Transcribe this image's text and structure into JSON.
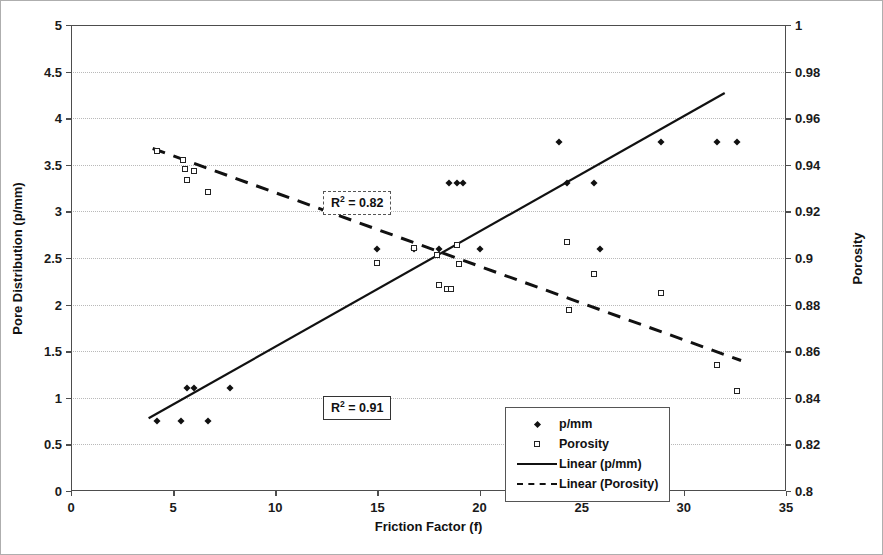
{
  "chart_data": {
    "type": "scatter",
    "title": "",
    "xlabel": "Friction Factor (f)",
    "ylabel": "Pore Distribution (p/mm)",
    "y2label": "Porosity",
    "xlim": [
      0,
      35
    ],
    "ylim": [
      0,
      5
    ],
    "y2lim": [
      0.8,
      1
    ],
    "grid": true,
    "legend_position": "center",
    "xticks": [
      "0",
      "5",
      "10",
      "15",
      "20",
      "25",
      "30",
      "35"
    ],
    "xtick_values": [
      0,
      5,
      10,
      15,
      20,
      25,
      30,
      35
    ],
    "yticks": [
      "0",
      "0.5",
      "1",
      "1.5",
      "2",
      "2.5",
      "3",
      "3.5",
      "4",
      "4.5",
      "5"
    ],
    "ytick_values": [
      0,
      0.5,
      1,
      1.5,
      2,
      2.5,
      3,
      3.5,
      4,
      4.5,
      5
    ],
    "y2ticks": [
      "0.8",
      "0.82",
      "0.84",
      "0.86",
      "0.88",
      "0.9",
      "0.92",
      "0.94",
      "0.96",
      "0.98",
      "1"
    ],
    "y2tick_values": [
      0.8,
      0.82,
      0.84,
      0.86,
      0.88,
      0.9,
      0.92,
      0.94,
      0.96,
      0.98,
      1
    ],
    "series": [
      {
        "name": "p/mm",
        "marker": "filled-diamond",
        "axis": "left",
        "points": [
          [
            4.2,
            0.75
          ],
          [
            5.4,
            0.75
          ],
          [
            5.7,
            1.1
          ],
          [
            6.0,
            1.1
          ],
          [
            6.7,
            0.75
          ],
          [
            7.8,
            1.1
          ],
          [
            15.0,
            2.6
          ],
          [
            16.8,
            2.6
          ],
          [
            18.0,
            2.6
          ],
          [
            18.5,
            3.3
          ],
          [
            18.9,
            3.3
          ],
          [
            19.2,
            3.3
          ],
          [
            20.0,
            2.6
          ],
          [
            23.9,
            3.75
          ],
          [
            24.3,
            3.3
          ],
          [
            25.6,
            3.3
          ],
          [
            25.9,
            2.6
          ],
          [
            28.9,
            3.75
          ],
          [
            31.6,
            3.75
          ],
          [
            32.6,
            3.75
          ]
        ]
      },
      {
        "name": "Porosity",
        "marker": "open-square",
        "axis": "right",
        "points": [
          [
            4.2,
            0.946
          ],
          [
            5.5,
            0.942
          ],
          [
            5.6,
            0.938
          ],
          [
            5.7,
            0.9335
          ],
          [
            6.0,
            0.9375
          ],
          [
            6.7,
            0.9285
          ],
          [
            15.0,
            0.898
          ],
          [
            16.8,
            0.9045
          ],
          [
            17.9,
            0.9015
          ],
          [
            18.0,
            0.8885
          ],
          [
            18.4,
            0.8865
          ],
          [
            18.6,
            0.8865
          ],
          [
            18.9,
            0.9055
          ],
          [
            19.0,
            0.8975
          ],
          [
            24.3,
            0.907
          ],
          [
            24.4,
            0.8775
          ],
          [
            25.6,
            0.893
          ],
          [
            28.9,
            0.885
          ],
          [
            31.6,
            0.854
          ],
          [
            32.6,
            0.843
          ]
        ]
      }
    ],
    "trendlines": [
      {
        "name": "Linear (p/mm)",
        "style": "solid",
        "axis": "left",
        "x_start": 3.8,
        "y_start": 0.78,
        "x_end": 32.0,
        "y_end": 4.27,
        "r_squared": "0.91",
        "r2_label": "R2 = 0.91"
      },
      {
        "name": "Linear (Porosity)",
        "style": "dashed",
        "axis": "right",
        "x_start": 4.0,
        "y_start": 0.947,
        "x_end": 32.8,
        "y_end": 0.856,
        "r_squared": "0.82",
        "r2_label": "R2 = 0.82"
      }
    ],
    "annotations": [
      {
        "id": "r2-porosity",
        "text": "R2 = 0.82",
        "value": "0.82",
        "border": "dashed"
      },
      {
        "id": "r2-pmm",
        "text": "R2 = 0.91",
        "value": "0.91",
        "border": "solid"
      }
    ],
    "legend_entries": [
      {
        "label": "p/mm",
        "key": "filled-diamond"
      },
      {
        "label": "Porosity",
        "key": "open-square"
      },
      {
        "label": "Linear (p/mm)",
        "key": "solid-line"
      },
      {
        "label": "Linear (Porosity)",
        "key": "dashed-line"
      }
    ]
  },
  "r2": {
    "prefix": "R",
    "exp": "2",
    "eq_porosity": " = 0.82",
    "eq_pmm": " = 0.91"
  }
}
